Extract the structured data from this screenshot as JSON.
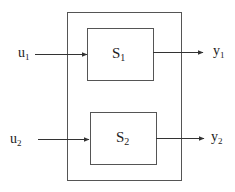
{
  "diagram": {
    "type": "block-diagram",
    "outer_system": {
      "label": ""
    },
    "blocks": [
      {
        "id": "S1",
        "base": "S",
        "sub": "1"
      },
      {
        "id": "S2",
        "base": "S",
        "sub": "2"
      }
    ],
    "inputs": [
      {
        "id": "u1",
        "base": "u",
        "sub": "1",
        "target": "S1"
      },
      {
        "id": "u2",
        "base": "u",
        "sub": "2",
        "target": "S2"
      }
    ],
    "outputs": [
      {
        "id": "y1",
        "base": "y",
        "sub": "1",
        "source": "S1"
      },
      {
        "id": "y2",
        "base": "y",
        "sub": "2",
        "source": "S2"
      }
    ],
    "colors": {
      "line": "#333333",
      "background": "#ffffff"
    }
  }
}
